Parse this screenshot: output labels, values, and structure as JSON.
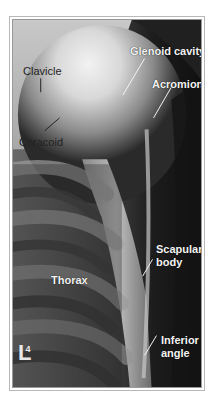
{
  "figure": {
    "colors": {
      "frame": "#9a9a9a",
      "background": "#ffffff",
      "label_light": "#f4f4f4",
      "label_dark": "#222222"
    },
    "labels": [
      {
        "id": "clavicle",
        "text": "Clavicle",
        "x": 10,
        "y": 45,
        "style": "dark"
      },
      {
        "id": "coracoid",
        "text": "Coracoid",
        "x": 6,
        "y": 116,
        "style": "dark"
      },
      {
        "id": "glenoid-cavity",
        "text": "Glenoid cavity",
        "x": 117,
        "y": 25,
        "style": "light"
      },
      {
        "id": "acromion",
        "text": "Acromion",
        "x": 139,
        "y": 58,
        "style": "light"
      },
      {
        "id": "scapular-body-line1",
        "text": "Scapular",
        "x": 143,
        "y": 223,
        "style": "light"
      },
      {
        "id": "scapular-body-line2",
        "text": "body",
        "x": 143,
        "y": 236,
        "style": "light"
      },
      {
        "id": "thorax",
        "text": "Thorax",
        "x": 38,
        "y": 254,
        "style": "light"
      },
      {
        "id": "inferior-angle-line1",
        "text": "Inferior",
        "x": 148,
        "y": 314,
        "style": "light"
      },
      {
        "id": "inferior-angle-line2",
        "text": "angle",
        "x": 148,
        "y": 327,
        "style": "light"
      }
    ],
    "marker": {
      "letter": "L",
      "subscript": "4"
    }
  }
}
